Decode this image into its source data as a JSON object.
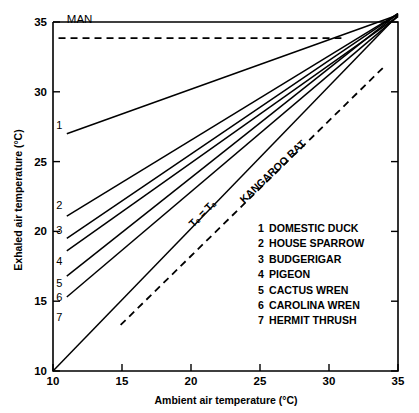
{
  "chart_data": {
    "type": "line",
    "title": "",
    "xlabel": "Ambient air temperature (°C)",
    "ylabel": "Exhaled air temperature (°C)",
    "xlim": [
      10,
      35
    ],
    "ylim": [
      10,
      35
    ],
    "xticks": [
      10,
      15,
      20,
      25,
      30,
      35
    ],
    "yticks": [
      10,
      15,
      20,
      25,
      30,
      35
    ],
    "xticklabels": [
      "10",
      "15",
      "20",
      "25",
      "30",
      "35"
    ],
    "yticklabels": [
      "10",
      "15",
      "20",
      "25",
      "30",
      "35"
    ],
    "grid": false,
    "legend_position": "inside-lower-right",
    "series": [
      {
        "key": "1",
        "name": "DOMESTIC DUCK",
        "style": "solid",
        "x": [
          11.0,
          35.0
        ],
        "y": [
          27.0,
          35.5
        ],
        "label_x": 10.45,
        "label_y": 27.6
      },
      {
        "key": "2",
        "name": "HOUSE SPARROW",
        "style": "solid",
        "x": [
          11.0,
          35.0
        ],
        "y": [
          21.1,
          35.6
        ],
        "label_x": 10.45,
        "label_y": 21.9
      },
      {
        "key": "3",
        "name": "BUDGERIGAR",
        "style": "solid",
        "x": [
          11.0,
          35.0
        ],
        "y": [
          19.5,
          35.6
        ],
        "label_x": 10.45,
        "label_y": 20.1
      },
      {
        "key": "4",
        "name": "PIGEON",
        "style": "solid",
        "x": [
          11.0,
          35.0
        ],
        "y": [
          18.6,
          35.4
        ],
        "label_x": 10.45,
        "label_y": 17.9
      },
      {
        "key": "5",
        "name": "CACTUS WREN",
        "style": "solid",
        "x": [
          11.0,
          35.0
        ],
        "y": [
          16.8,
          35.6
        ],
        "label_x": 10.45,
        "label_y": 16.3
      },
      {
        "key": "6",
        "name": "CAROLINA WREN",
        "style": "solid",
        "x": [
          11.0,
          35.0
        ],
        "y": [
          15.3,
          35.4
        ],
        "label_x": 10.45,
        "label_y": 15.3
      },
      {
        "key": "7",
        "name": "HERMIT THRUSH",
        "style": "solid",
        "x": [
          10.0,
          35.0
        ],
        "y": [
          10.0,
          35.5
        ],
        "label_x": 10.45,
        "label_y": 13.9
      }
    ],
    "reference_lines": [
      {
        "key": "man",
        "name": "MAN",
        "style": "dashed",
        "x": [
          10.4,
          30.9
        ],
        "y": [
          33.85,
          33.85
        ],
        "label": "MAN",
        "label_x": 11.0,
        "label_y": 34.95
      },
      {
        "key": "kangaroo-rat",
        "name": "KANGAROO RAT",
        "style": "dashed",
        "x": [
          14.9,
          34.1
        ],
        "y": [
          13.3,
          31.9
        ],
        "label": "KANGAROO RAT",
        "label_x": 26.1,
        "label_y": 24.1,
        "label_rotation": -43.5
      }
    ],
    "annotations": [
      {
        "key": "te-eq-ta",
        "text": "Tₑ = Tₐ",
        "text_plain": "Te = Ta",
        "x": 21.0,
        "y": 21.1,
        "rotation": -45.5
      }
    ]
  },
  "legend": {
    "entries": [
      {
        "number": "1",
        "label": "DOMESTIC DUCK"
      },
      {
        "number": "2",
        "label": "HOUSE SPARROW"
      },
      {
        "number": "3",
        "label": "BUDGERIGAR"
      },
      {
        "number": "4",
        "label": "PIGEON"
      },
      {
        "number": "5",
        "label": "CACTUS WREN"
      },
      {
        "number": "6",
        "label": "CAROLINA WREN"
      },
      {
        "number": "7",
        "label": "HERMIT THRUSH"
      }
    ]
  },
  "colors": {
    "ink": "#000000",
    "background": "#ffffff"
  }
}
